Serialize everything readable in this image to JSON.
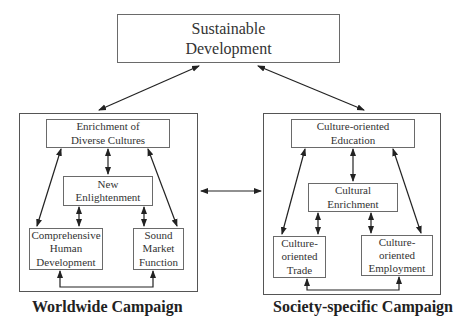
{
  "diagram": {
    "top": {
      "line1": "Sustainable",
      "line2": "Development"
    },
    "left": {
      "title": "Worldwide Campaign",
      "boxes": {
        "enrichment": {
          "line1": "Enrichment of",
          "line2": "Diverse Cultures"
        },
        "enlightenment": {
          "line1": "New",
          "line2": "Enlightenment"
        },
        "human": {
          "line1": "Comprehensive",
          "line2": "Human",
          "line3": "Development"
        },
        "market": {
          "line1": "Sound",
          "line2": "Market",
          "line3": "Function"
        }
      }
    },
    "right": {
      "title": "Society-specific Campaign",
      "boxes": {
        "education": {
          "line1": "Culture-oriented",
          "line2": "Education"
        },
        "cultural": {
          "line1": "Cultural",
          "line2": "Enrichment"
        },
        "trade": {
          "line1": "Culture-",
          "line2": "oriented",
          "line3": "Trade"
        },
        "employment": {
          "line1": "Culture-",
          "line2": "oriented",
          "line3": "Employment"
        }
      }
    }
  }
}
